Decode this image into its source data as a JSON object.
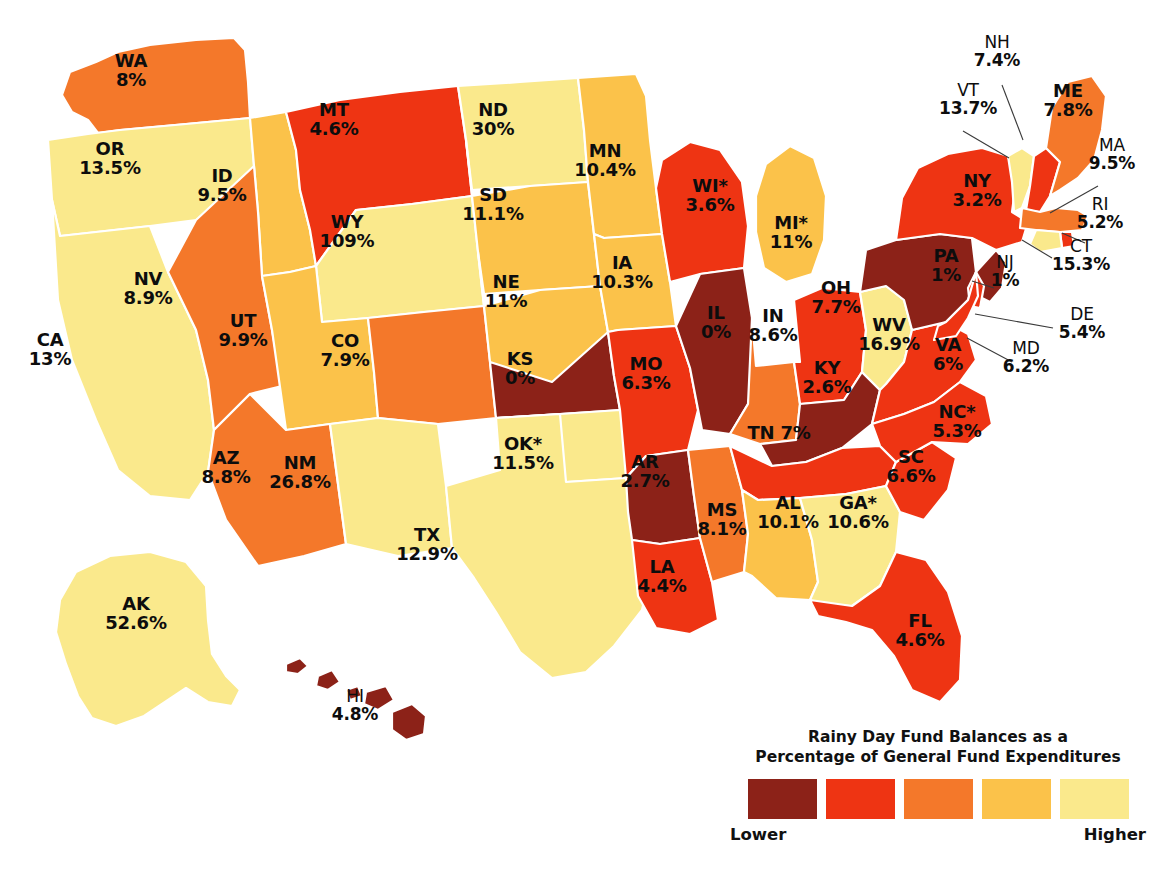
{
  "legend": {
    "title_line1": "Rainy Day Fund Balances as a",
    "title_line2": "Percentage of General Fund Expenditures",
    "low_label": "Lower",
    "high_label": "Higher",
    "swatches": [
      "#8c2218",
      "#ef3413",
      "#f47b20",
      "#fac council",
      "#fae98a"
    ]
  },
  "palette": {
    "bin1_darkred": "#8c2218",
    "bin2_red": "#ee3413",
    "bin3_orange": "#f4782a",
    "bin4_gold": "#fbc martin",
    "bin5_paleyellow": "#fae98c",
    "border": "#ffffff",
    "text": "#0d0d0d",
    "background": "#ffffff"
  },
  "chart_data": {
    "type": "map",
    "title": "Rainy Day Fund Balances as a Percentage of General Fund Expenditures",
    "unit": "%",
    "legend_order": [
      "Lower",
      "Higher"
    ],
    "bins": [
      {
        "index": 1,
        "color": "#8c2218",
        "meaning": "Lowest"
      },
      {
        "index": 2,
        "color": "#ee3413",
        "meaning": "Low"
      },
      {
        "index": 3,
        "color": "#f4782a",
        "meaning": "Middle"
      },
      {
        "index": 4,
        "color": "#fbc24a",
        "meaning": "High"
      },
      {
        "index": 5,
        "color": "#fae98c",
        "meaning": "Highest"
      }
    ],
    "note": "* indicates asterisk shown next to the state abbreviation on the map",
    "states": [
      {
        "id": "WA",
        "abbr": "WA",
        "value": "8%",
        "num": 8.0,
        "bin": 3,
        "x": 131,
        "y": 70,
        "layout": "stack"
      },
      {
        "id": "OR",
        "abbr": "OR",
        "value": "13.5%",
        "num": 13.5,
        "bin": 5,
        "x": 110,
        "y": 158,
        "layout": "stack"
      },
      {
        "id": "CA",
        "abbr": "CA",
        "value": "13%",
        "num": 13.0,
        "bin": 5,
        "x": 50,
        "y": 349,
        "layout": "stack"
      },
      {
        "id": "ID",
        "abbr": "ID",
        "value": "9.5%",
        "num": 9.5,
        "bin": 4,
        "x": 222,
        "y": 185,
        "layout": "stack"
      },
      {
        "id": "NV",
        "abbr": "NV",
        "value": "8.9%",
        "num": 8.9,
        "bin": 3,
        "x": 148,
        "y": 288,
        "layout": "stack"
      },
      {
        "id": "MT",
        "abbr": "MT",
        "value": "4.6%",
        "num": 4.6,
        "bin": 2,
        "x": 334,
        "y": 119,
        "layout": "stack"
      },
      {
        "id": "WY",
        "abbr": "WY",
        "value": "109%",
        "num": 109.0,
        "bin": 5,
        "x": 347,
        "y": 231,
        "layout": "stack"
      },
      {
        "id": "UT",
        "abbr": "UT",
        "value": "9.9%",
        "num": 9.9,
        "bin": 4,
        "x": 243,
        "y": 330,
        "layout": "stack"
      },
      {
        "id": "AZ",
        "abbr": "AZ",
        "value": "8.8%",
        "num": 8.8,
        "bin": 3,
        "x": 226,
        "y": 467,
        "layout": "stack"
      },
      {
        "id": "CO",
        "abbr": "CO",
        "value": "7.9%",
        "num": 7.9,
        "bin": 3,
        "x": 345,
        "y": 350,
        "layout": "stack"
      },
      {
        "id": "NM",
        "abbr": "NM",
        "value": "26.8%",
        "num": 26.8,
        "bin": 5,
        "x": 300,
        "y": 472,
        "layout": "stack"
      },
      {
        "id": "ND",
        "abbr": "ND",
        "value": "30%",
        "num": 30.0,
        "bin": 5,
        "x": 493,
        "y": 119,
        "layout": "stack"
      },
      {
        "id": "SD",
        "abbr": "SD",
        "value": "11.1%",
        "num": 11.1,
        "bin": 4,
        "x": 493,
        "y": 204,
        "layout": "stack"
      },
      {
        "id": "NE",
        "abbr": "NE",
        "value": "11%",
        "num": 11.0,
        "bin": 4,
        "x": 506,
        "y": 291,
        "layout": "stack"
      },
      {
        "id": "KS",
        "abbr": "KS",
        "value": "0%",
        "num": 0.0,
        "bin": 1,
        "x": 520,
        "y": 368,
        "layout": "stack"
      },
      {
        "id": "OK",
        "abbr": "OK*",
        "value": "11.5%",
        "num": 11.5,
        "bin": 5,
        "x": 523,
        "y": 453,
        "layout": "stack"
      },
      {
        "id": "TX",
        "abbr": "TX",
        "value": "12.9%",
        "num": 12.9,
        "bin": 5,
        "x": 427,
        "y": 544,
        "layout": "stack"
      },
      {
        "id": "MN",
        "abbr": "MN",
        "value": "10.4%",
        "num": 10.4,
        "bin": 4,
        "x": 605,
        "y": 160,
        "layout": "stack"
      },
      {
        "id": "IA",
        "abbr": "IA",
        "value": "10.3%",
        "num": 10.3,
        "bin": 4,
        "x": 622,
        "y": 272,
        "layout": "stack"
      },
      {
        "id": "MO",
        "abbr": "MO",
        "value": "6.3%",
        "num": 6.3,
        "bin": 2,
        "x": 646,
        "y": 373,
        "layout": "stack"
      },
      {
        "id": "AR",
        "abbr": "AR",
        "value": "2.7%",
        "num": 2.7,
        "bin": 1,
        "x": 645,
        "y": 471,
        "layout": "stack"
      },
      {
        "id": "LA",
        "abbr": "LA",
        "value": "4.4%",
        "num": 4.4,
        "bin": 2,
        "x": 662,
        "y": 576,
        "layout": "stack"
      },
      {
        "id": "WI",
        "abbr": "WI*",
        "value": "3.6%",
        "num": 3.6,
        "bin": 2,
        "x": 710,
        "y": 195,
        "layout": "stack"
      },
      {
        "id": "IL",
        "abbr": "IL",
        "value": "0%",
        "num": 0.0,
        "bin": 1,
        "x": 716,
        "y": 322,
        "layout": "stack"
      },
      {
        "id": "MS",
        "abbr": "MS",
        "value": "8.1%",
        "num": 8.1,
        "bin": 3,
        "x": 722,
        "y": 519,
        "layout": "stack"
      },
      {
        "id": "MI",
        "abbr": "MI*",
        "value": "11%",
        "num": 11.0,
        "bin": 4,
        "x": 791,
        "y": 232,
        "layout": "stack"
      },
      {
        "id": "IN",
        "abbr": "IN",
        "value": "8.6%",
        "num": 8.6,
        "bin": 3,
        "x": 773,
        "y": 325,
        "layout": "stack"
      },
      {
        "id": "KY",
        "abbr": "KY",
        "value": "2.6%",
        "num": 2.6,
        "bin": 1,
        "x": 827,
        "y": 377,
        "layout": "stack"
      },
      {
        "id": "TN",
        "abbr": "TN",
        "value": "7%",
        "num": 7.0,
        "bin": 2,
        "x": 779,
        "y": 442,
        "layout": "inline"
      },
      {
        "id": "AL",
        "abbr": "AL",
        "value": "10.1%",
        "num": 10.1,
        "bin": 4,
        "x": 788,
        "y": 512,
        "layout": "stack"
      },
      {
        "id": "OH",
        "abbr": "OH",
        "value": "7.7%",
        "num": 7.7,
        "bin": 2,
        "x": 836,
        "y": 297,
        "layout": "stack"
      },
      {
        "id": "GA",
        "abbr": "GA*",
        "value": "10.6%",
        "num": 10.6,
        "bin": 5,
        "x": 858,
        "y": 512,
        "layout": "stack"
      },
      {
        "id": "FL",
        "abbr": "FL",
        "value": "4.6%",
        "num": 4.6,
        "bin": 2,
        "x": 920,
        "y": 630,
        "layout": "stack"
      },
      {
        "id": "SC",
        "abbr": "SC",
        "value": "6.6%",
        "num": 6.6,
        "bin": 2,
        "x": 911,
        "y": 466,
        "layout": "stack"
      },
      {
        "id": "WV",
        "abbr": "WV",
        "value": "16.9%",
        "num": 16.9,
        "bin": 5,
        "x": 889,
        "y": 334,
        "layout": "stack"
      },
      {
        "id": "VA",
        "abbr": "VA",
        "value": "6%",
        "num": 6.0,
        "bin": 2,
        "x": 948,
        "y": 354,
        "layout": "stack"
      },
      {
        "id": "NC",
        "abbr": "NC*",
        "value": "5.3%",
        "num": 5.3,
        "bin": 2,
        "x": 957,
        "y": 421,
        "layout": "stack"
      },
      {
        "id": "PA",
        "abbr": "PA",
        "value": "1%",
        "num": 1.0,
        "bin": 1,
        "x": 946,
        "y": 265,
        "layout": "stack"
      },
      {
        "id": "NY",
        "abbr": "NY",
        "value": "3.2%",
        "num": 3.2,
        "bin": 2,
        "x": 977,
        "y": 190,
        "layout": "stack"
      },
      {
        "id": "ME",
        "abbr": "ME",
        "value": "7.8%",
        "num": 7.8,
        "bin": 3,
        "x": 1068,
        "y": 100,
        "layout": "stack"
      },
      {
        "id": "AK",
        "abbr": "AK",
        "value": "52.6%",
        "num": 52.6,
        "bin": 5,
        "x": 136,
        "y": 613,
        "layout": "stack"
      }
    ],
    "callout_states": [
      {
        "id": "NH",
        "abbr": "NH",
        "value": "7.4%",
        "num": 7.4,
        "bin": 2,
        "x": 997,
        "y": 52,
        "lx1": 1002,
        "ly1": 85,
        "lx2": 1023,
        "ly2": 140
      },
      {
        "id": "VT",
        "abbr": "VT",
        "value": "13.7%",
        "num": 13.7,
        "bin": 5,
        "x": 968,
        "y": 100,
        "lx1": 963,
        "ly1": 131,
        "lx2": 1009,
        "ly2": 158
      },
      {
        "id": "MA",
        "abbr": "MA",
        "value": "9.5%",
        "num": 9.5,
        "bin": 3,
        "x": 1112,
        "y": 155,
        "lx1": 1098,
        "ly1": 186,
        "lx2": 1050,
        "ly2": 213
      },
      {
        "id": "RI",
        "abbr": "RI",
        "value": "5.2%",
        "num": 5.2,
        "bin": 2,
        "x": 1100,
        "y": 214,
        "lx1": 1085,
        "ly1": 243,
        "lx2": 1062,
        "ly2": 233
      },
      {
        "id": "CT",
        "abbr": "CT",
        "value": "15.3%",
        "num": 15.3,
        "bin": 5,
        "x": 1081,
        "y": 256,
        "lx1": 1052,
        "ly1": 258,
        "lx2": 1022,
        "ly2": 240
      },
      {
        "id": "NJ",
        "abbr": "NJ",
        "value": "1%",
        "num": 1.0,
        "bin": 1,
        "x": 1005,
        "y": 272,
        "lx1": 994,
        "ly1": 288,
        "lx2": 972,
        "ly2": 281
      },
      {
        "id": "DE",
        "abbr": "DE",
        "value": "5.4%",
        "num": 5.4,
        "bin": 2,
        "x": 1082,
        "y": 324,
        "lx1": 1053,
        "ly1": 328,
        "lx2": 975,
        "ly2": 314
      },
      {
        "id": "MD",
        "abbr": "MD",
        "value": "6.2%",
        "num": 6.2,
        "bin": 2,
        "x": 1026,
        "y": 358,
        "lx1": 1012,
        "ly1": 362,
        "lx2": 967,
        "ly2": 338
      },
      {
        "id": "HI",
        "abbr": "HI",
        "value": "4.8%",
        "num": 4.8,
        "bin": 1,
        "x": 355,
        "y": 706,
        "lx1": 0,
        "ly1": 0,
        "lx2": 0,
        "ly2": 0
      }
    ]
  }
}
